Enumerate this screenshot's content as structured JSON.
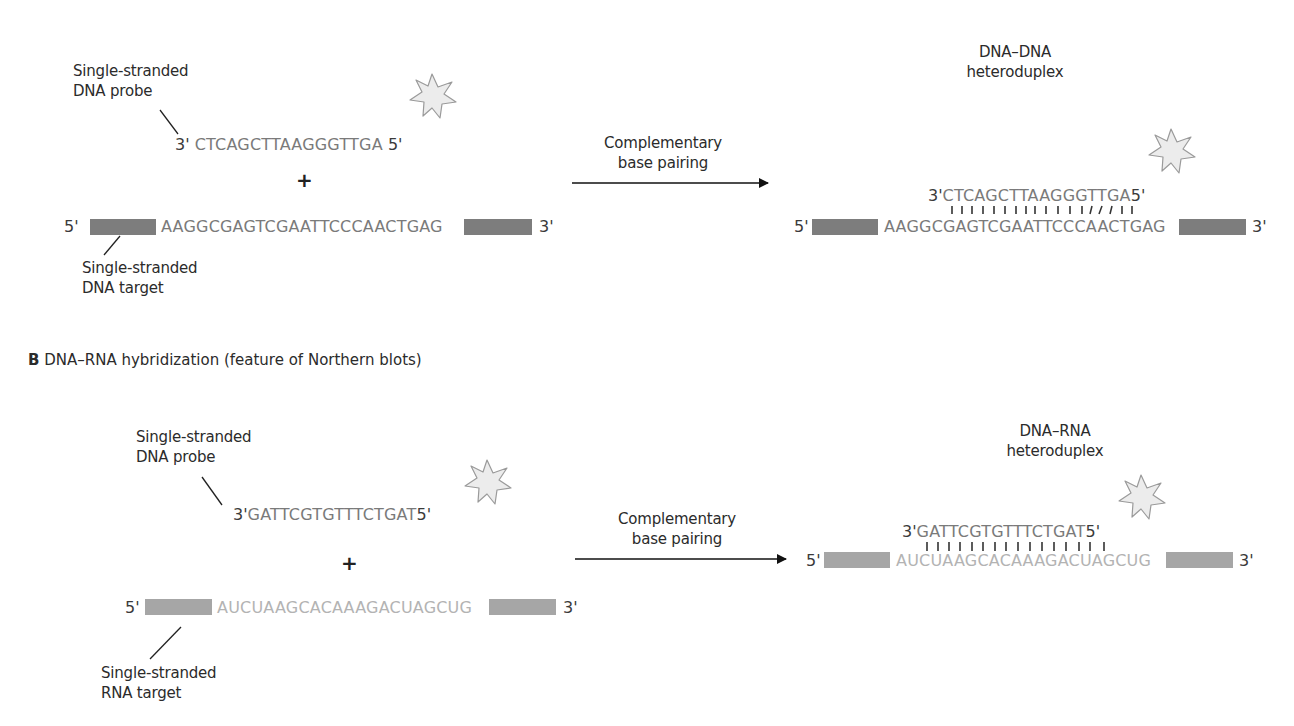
{
  "section_a": {
    "probe_label": [
      "Single-stranded",
      "DNA  probe"
    ],
    "probe": {
      "left_end": "3'",
      "sequence": "CTCAGCTTAAGGGTTGA",
      "right_end": "5'"
    },
    "plus": "+",
    "target": {
      "left_end": "5'",
      "sequence": "AAGGCGAGTCGAATTCCCAACTGAG",
      "right_end": "3'"
    },
    "target_label": [
      "Single-stranded",
      "DNA target"
    ],
    "arrow_label": [
      "Complementary",
      "base pairing"
    ],
    "product_label": [
      "DNA–DNA",
      "heteroduplex"
    ],
    "product_probe": {
      "left_end": "3'",
      "sequence": "CTCAGCTTAAGGGTTGA",
      "right_end": "5'"
    },
    "product_target": {
      "left_end": "5'",
      "sequence": "AAGGCGAGTCGAATTCCCAACTGAG",
      "right_end": "3'"
    }
  },
  "section_b": {
    "title_letter": "B",
    "title_text": " DNA–RNA hybridization (feature of Northern blots)",
    "probe_label": [
      "Single-stranded",
      "DNA probe"
    ],
    "probe": {
      "left_end": "3'",
      "sequence": "GATTCGTGTTTCTGAT",
      "right_end": "5'"
    },
    "plus": "+",
    "target": {
      "left_end": "5'",
      "sequence": "AUCUAAGCACAAAGACUAGCUG",
      "right_end": "3'"
    },
    "target_label": [
      "Single-stranded",
      "RNA target"
    ],
    "arrow_label": [
      "Complementary",
      "base pairing"
    ],
    "product_label": [
      "DNA–RNA",
      "heteroduplex"
    ],
    "product_probe": {
      "left_end": "3'",
      "sequence": "GATTCGTGTTTCTGAT",
      "right_end": "5'"
    },
    "product_target": {
      "left_end": "5'",
      "sequence": "AUCUAAGCACAAAGACUAGCUG",
      "right_end": "3'"
    }
  },
  "icons": {
    "label_marker": "star-burst-icon"
  },
  "colors": {
    "dna_sequence": "#7a7a7a",
    "rna_sequence": "#b3b3b3",
    "dna_flank_bar": "#7d7d7d",
    "rna_flank_bar": "#a6a6a6",
    "star_fill": "#ececec",
    "star_stroke": "#9a9a9a"
  }
}
